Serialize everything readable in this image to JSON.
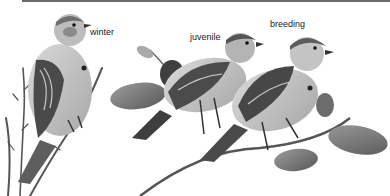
{
  "figure": {
    "captions": {
      "winter": "winter",
      "juvenile": "juvenile",
      "breeding": "breeding"
    },
    "colors": {
      "background": "#ffffff",
      "rule": "#6a6a6a",
      "text": "#222222"
    }
  }
}
